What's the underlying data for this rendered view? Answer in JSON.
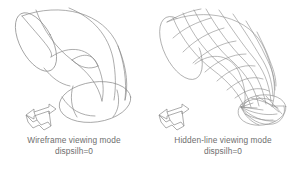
{
  "figure": {
    "background_color": "#ffffff",
    "line_color": "#8a8a8a",
    "text_color": "#6e6e6e",
    "width": 297,
    "height": 175
  },
  "panels": [
    {
      "id": "wireframe",
      "caption_line1": "Wireframe viewing mode",
      "caption_line2": "dispsilh=0",
      "object_name": "elbow-pipe-wireframe",
      "ucs_icon_name": "ucs-axis-icon"
    },
    {
      "id": "hiddenline",
      "caption_line1": "Hidden-line viewing mode",
      "caption_line2": "dispsilh=0",
      "object_name": "elbow-pipe-hidden-line-mesh",
      "ucs_icon_name": "ucs-axis-icon"
    }
  ]
}
